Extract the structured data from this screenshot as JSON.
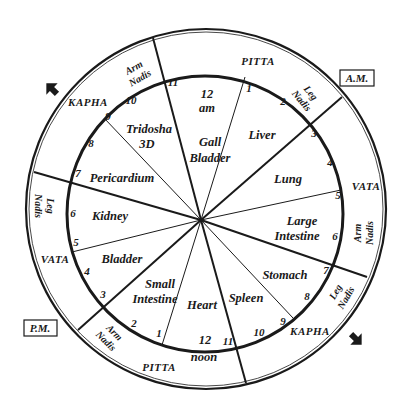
{
  "diagram": {
    "period_labels": {
      "am": "A.M.",
      "pm": "P.M."
    },
    "center_labels": {
      "top": [
        "12",
        "am"
      ],
      "bottom": [
        "12",
        "noon"
      ]
    },
    "organs": [
      {
        "name": "Gall Bladder",
        "lines": [
          "Gall",
          "Bladder"
        ]
      },
      {
        "name": "Liver",
        "lines": [
          "Liver"
        ]
      },
      {
        "name": "Lung",
        "lines": [
          "Lung"
        ]
      },
      {
        "name": "Large Intestine",
        "lines": [
          "Large",
          "Intestine"
        ]
      },
      {
        "name": "Stomach",
        "lines": [
          "Stomach"
        ]
      },
      {
        "name": "Spleen",
        "lines": [
          "Spleen"
        ]
      },
      {
        "name": "Heart",
        "lines": [
          "Heart"
        ]
      },
      {
        "name": "Small Intestine",
        "lines": [
          "Small",
          "Intestine"
        ]
      },
      {
        "name": "Bladder",
        "lines": [
          "Bladder"
        ]
      },
      {
        "name": "Kidney",
        "lines": [
          "Kidney"
        ]
      },
      {
        "name": "Pericardium",
        "lines": [
          "Pericardium"
        ]
      },
      {
        "name": "Tridosha 3D",
        "lines": [
          "Tridosha",
          "3D"
        ]
      }
    ],
    "hours_am": [
      "1",
      "2",
      "3",
      "4",
      "5",
      "6",
      "7",
      "8",
      "9",
      "10",
      "11"
    ],
    "hours_pm": [
      "1",
      "2",
      "3",
      "4",
      "5",
      "6",
      "7",
      "8",
      "9",
      "10",
      "11"
    ],
    "doshas": {
      "top": "PITTA",
      "right": "VATA",
      "bottom_right": "KAPHA",
      "bottom": "PITTA",
      "left": "VATA",
      "top_left": "KAPHA"
    },
    "nadis": {
      "top_left": [
        "Arm",
        "Nadis"
      ],
      "top_right": [
        "Leg",
        "Nadis"
      ],
      "right": [
        "Arm",
        "Nadis"
      ],
      "bottom_right": [
        "Leg",
        "Nadis"
      ],
      "bottom_left": [
        "Arm",
        "Nadis"
      ],
      "left": [
        "Leg",
        "Nadis"
      ]
    },
    "colors": {
      "ink": "#1a1a1a",
      "background": "#ffffff"
    }
  }
}
